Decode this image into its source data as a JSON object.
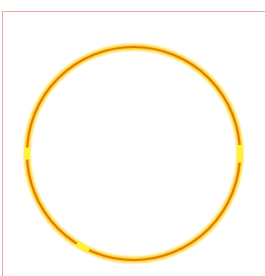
{
  "canvas": {
    "width": 265,
    "height": 276,
    "background": "#ffffff"
  },
  "frame": {
    "border_color": "#eba7a0",
    "sides": [
      "top",
      "left"
    ]
  },
  "circle": {
    "shape": "circle",
    "center_x": 133.5,
    "center_y": 153.5,
    "radius": 106.5,
    "stroke_color": "#e07a10",
    "glow_color": "#ffd21a",
    "highlight_color": "#fff230",
    "highlight_segments": [
      "left",
      "right",
      "bottom-left"
    ]
  }
}
